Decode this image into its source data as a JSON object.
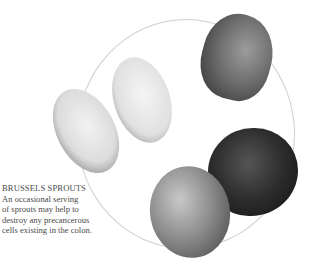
{
  "caption": {
    "title": "BRUSSELS SPROUTS",
    "lines": [
      "An occasional serving",
      "of sprouts may help to",
      "destroy any precancerous",
      "cells existing in the colon."
    ]
  },
  "illustration": {
    "subject": "brussels-sprouts",
    "count": 5,
    "frame": "circle",
    "frame_color": "#cfcfcf"
  }
}
